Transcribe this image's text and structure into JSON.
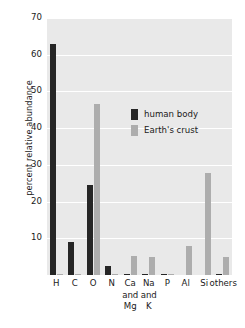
{
  "chart_data": {
    "type": "bar",
    "title": "",
    "subtitle": "",
    "xlabel": "",
    "ylabel": "percent relative abundance",
    "ylim": [
      0,
      70
    ],
    "yticks": [
      10,
      20,
      30,
      40,
      50,
      60,
      70
    ],
    "ytick_labels": [
      "10",
      "20",
      "30",
      "40",
      "50",
      "60",
      "70"
    ],
    "grid": true,
    "legend_position": "inside-upper-right",
    "categories": [
      "H",
      "C",
      "O",
      "N",
      "Ca and Mg",
      "Na and K",
      "P",
      "Al",
      "Si",
      "others"
    ],
    "category_lines": [
      [
        "H"
      ],
      [
        "C"
      ],
      [
        "O"
      ],
      [
        "N"
      ],
      [
        "Ca",
        "and",
        "Mg"
      ],
      [
        "Na",
        "and",
        "K"
      ],
      [
        "P"
      ],
      [
        "Al"
      ],
      [
        "Si"
      ],
      [
        "others"
      ]
    ],
    "series": [
      {
        "name": "human body",
        "color": "#262626",
        "values": [
          63.0,
          9.0,
          24.5,
          2.5,
          0.4,
          0.4,
          0.3,
          0.0,
          0.0,
          0.4
        ]
      },
      {
        "name": "Earth's crust",
        "color": "#adadad",
        "values": [
          0.3,
          0.2,
          46.6,
          0.2,
          5.3,
          4.9,
          0.2,
          8.0,
          27.8,
          4.8
        ]
      }
    ]
  },
  "legend": {
    "items": [
      {
        "label": "human body",
        "swatch": "legend-swatch-human-body",
        "color": "#262626"
      },
      {
        "label": "Earth's crust",
        "swatch": "legend-swatch-earths-crust",
        "color": "#adadad"
      }
    ]
  },
  "style": {
    "plot_background": "#e9e9e9",
    "gridline_color": "#ffffff",
    "page_background": "#ffffff",
    "text_color": "#1a1a1a"
  }
}
